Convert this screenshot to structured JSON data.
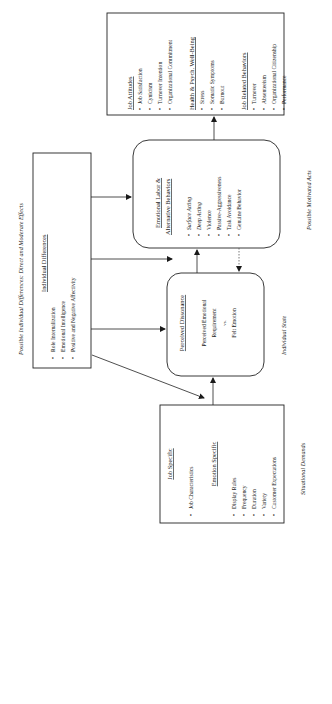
{
  "diagram": {
    "orientation": "rotated-90-ccw",
    "captions": {
      "top": "Possible Individual Differences: Direct and Moderate Effects",
      "individual_state": "Individual State",
      "motivated_acts": "Possible Motivated Acts",
      "situational_demands": "Situational Demands"
    },
    "individual_differences": {
      "title": "Individual Differences",
      "items": [
        "Role Internalization",
        "Emotional Intelligence",
        "Positive and Negative Affectivity"
      ]
    },
    "situational": {
      "title1": "Job Specific",
      "items1": [
        "Job Characteristics"
      ],
      "title2": "Emotion Specific",
      "items2": [
        "Display Rules",
        "Frequency",
        "Duration",
        "Variety",
        "Customer Expectations"
      ]
    },
    "dissonance": {
      "title": "Perceived Dissonance",
      "line1": "Perceived Emotional",
      "line2": "Requirement",
      "line3": "vs.",
      "line4": "Felt Emotion"
    },
    "emotional_labor": {
      "title1": "Emotional Labor &",
      "title2": "Alternative Behaviors",
      "items": [
        "Surface Acting",
        "Deep Acting",
        "Violence",
        "Passive-Aggressiveness",
        "Task Avoidance",
        "Genuine Behavior"
      ]
    },
    "outcomes": {
      "job_attitudes": {
        "title": "Job Attitudes",
        "items": [
          "Job Satisfaction",
          "Cynicism",
          "Turnover Intention",
          "Organizational Commitment"
        ]
      },
      "health": {
        "title": "Health & Psych. Well-Being",
        "items": [
          "Stress",
          "Somatic Symptoms",
          "Burnout"
        ]
      },
      "job_behaviors": {
        "title": "Job Related Behaviors",
        "items": [
          "Turnover",
          "Absenteeism",
          "Organizational Citizenship",
          "Performance"
        ]
      }
    }
  }
}
